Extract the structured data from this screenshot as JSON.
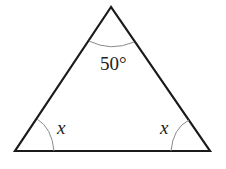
{
  "diagram": {
    "type": "triangle",
    "vertices": {
      "apex": {
        "x": 111,
        "y": 7
      },
      "bottom_left": {
        "x": 15,
        "y": 151
      },
      "bottom_right": {
        "x": 210,
        "y": 151
      }
    },
    "angles": {
      "apex": {
        "label": "50°"
      },
      "bottom_left": {
        "label": "x"
      },
      "bottom_right": {
        "label": "x"
      }
    },
    "colors": {
      "stroke": "#1a1a1a",
      "arc": "#8a8a8a",
      "text": "#222222",
      "background": "#ffffff"
    }
  }
}
